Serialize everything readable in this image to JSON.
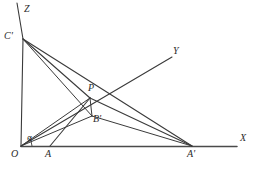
{
  "figure": {
    "background_color": "#ffffff",
    "stroke_color": "#3a3a3a",
    "label_color": "#2b2b2b",
    "width": 254,
    "height": 170
  },
  "axes": [
    {
      "name": "x-axis",
      "label": "X",
      "label_x": 240,
      "label_y": 135,
      "from": [
        21,
        146
      ],
      "to": [
        237,
        146
      ]
    },
    {
      "name": "y-axis",
      "label": "Y",
      "label_x": 173,
      "label_y": 48,
      "from": [
        21,
        146
      ],
      "to": [
        172,
        57
      ]
    },
    {
      "name": "z-axis",
      "label": "Z",
      "label_x": 24,
      "label_y": 4,
      "from": [
        17,
        3
      ],
      "to": [
        21,
        146
      ]
    }
  ],
  "points": [
    {
      "name": "O",
      "label": "O",
      "x": 21,
      "y": 146,
      "label_x": 11,
      "label_y": 150
    },
    {
      "name": "A",
      "label": "A",
      "x": 50,
      "y": 146,
      "label_x": 45,
      "label_y": 150
    },
    {
      "name": "A'",
      "label": "A'",
      "x": 192,
      "y": 146,
      "label_x": 187,
      "label_y": 150
    },
    {
      "name": "C'",
      "label": "C'",
      "x": 23,
      "y": 39,
      "label_x": 5,
      "label_y": 32
    },
    {
      "name": "P",
      "label": "P",
      "x": 90,
      "y": 98,
      "label_x": 89,
      "label_y": 83
    },
    {
      "name": "B'",
      "label": "B'",
      "x": 92,
      "y": 116,
      "label_x": 93,
      "label_y": 116
    }
  ],
  "angle": {
    "name": "alpha",
    "label": "α",
    "vertex": [
      21,
      146
    ],
    "label_x": 27,
    "label_y": 136,
    "arc_radius": 9
  },
  "segments": [
    {
      "name": "segment-Cprime-O",
      "from": [
        23,
        39
      ],
      "to": [
        21,
        146
      ]
    },
    {
      "name": "segment-Cprime-P",
      "from": [
        23,
        39
      ],
      "to": [
        90,
        98
      ]
    },
    {
      "name": "segment-Cprime-Bprime",
      "from": [
        23,
        39
      ],
      "to": [
        92,
        116
      ]
    },
    {
      "name": "segment-Cprime-Aprime",
      "from": [
        23,
        39
      ],
      "to": [
        192,
        146
      ]
    },
    {
      "name": "segment-O-P",
      "from": [
        21,
        146
      ],
      "to": [
        90,
        98
      ]
    },
    {
      "name": "segment-O-Bprime",
      "from": [
        21,
        146
      ],
      "to": [
        92,
        116
      ]
    },
    {
      "name": "segment-P-A",
      "from": [
        90,
        98
      ],
      "to": [
        50,
        146
      ]
    },
    {
      "name": "segment-P-Aprime",
      "from": [
        90,
        98
      ],
      "to": [
        192,
        146
      ]
    },
    {
      "name": "segment-Bprime-Aprime",
      "from": [
        92,
        116
      ],
      "to": [
        192,
        146
      ]
    },
    {
      "name": "segment-P-Bprime",
      "from": [
        90,
        98
      ],
      "to": [
        92,
        116
      ]
    }
  ],
  "caption": {
    "text": "",
    "x": 95,
    "y": 163
  }
}
